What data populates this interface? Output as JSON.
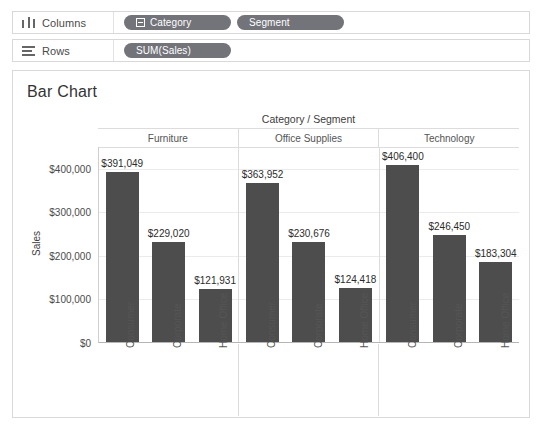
{
  "shelves": {
    "columns": {
      "icon": "columns-icon",
      "label": "Columns",
      "pills": [
        {
          "label": "Category",
          "has_expand_icon": true
        },
        {
          "label": "Segment",
          "has_expand_icon": false
        }
      ]
    },
    "rows": {
      "icon": "rows-icon",
      "label": "Rows",
      "pills": [
        {
          "label": "SUM(Sales)",
          "has_expand_icon": false
        }
      ]
    }
  },
  "card": {
    "title": "Bar Chart"
  },
  "chart_data": {
    "type": "bar",
    "title": "Bar Chart",
    "column_header_title": "Category / Segment",
    "xlabel": "Category / Segment",
    "ylabel": "Sales",
    "ylim": [
      0,
      450000
    ],
    "grid": true,
    "legend": "none",
    "y_ticks": [
      {
        "value": 0,
        "label": "$0"
      },
      {
        "value": 100000,
        "label": "$100,000"
      },
      {
        "value": 200000,
        "label": "$200,000"
      },
      {
        "value": 300000,
        "label": "$300,000"
      },
      {
        "value": 400000,
        "label": "$400,000"
      }
    ],
    "panels": [
      {
        "category": "Furniture",
        "categories": [
          "Consumer",
          "Corporate",
          "Home Office"
        ],
        "values": [
          391049,
          229020,
          121931
        ],
        "value_labels": [
          "$391,049",
          "$229,020",
          "$121,931"
        ]
      },
      {
        "category": "Office Supplies",
        "categories": [
          "Consumer",
          "Corporate",
          "Home Office"
        ],
        "values": [
          363952,
          230676,
          124418
        ],
        "value_labels": [
          "$363,952",
          "$230,676",
          "$124,418"
        ]
      },
      {
        "category": "Technology",
        "categories": [
          "Consumer",
          "Corporate",
          "Home Office"
        ],
        "values": [
          406400,
          246450,
          183304
        ],
        "value_labels": [
          "$406,400",
          "$246,450",
          "$183,304"
        ]
      }
    ],
    "bar_color": "#4d4d4d",
    "gridline_color": "#ebebeb"
  }
}
